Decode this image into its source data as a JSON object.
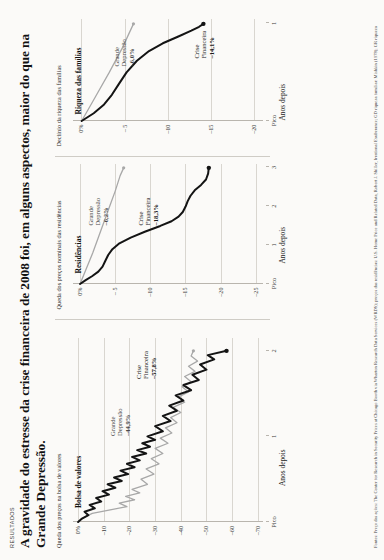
{
  "kicker": "RESULTADOS",
  "headline": "A gravidade do estresse da crise financeira de 2008 foi, em alguns aspectos, maior do que na Grande Depressão.",
  "legend": {
    "great_depression": "Grande Depressão",
    "financial_crisis": "Crise Financeira",
    "color_great_depression": "#a8a8a8",
    "color_financial_crisis": "#141414"
  },
  "axis": {
    "x_label": "Anos depois",
    "peak_label": "Pico"
  },
  "panels": [
    {
      "title": "Bolsa de valores",
      "subtitle": "Queda dos preços na bolsa de valores",
      "yticks": [
        "0%",
        "–10",
        "–20",
        "–30",
        "–40",
        "–50",
        "–60",
        "–70"
      ],
      "ytick_values": [
        0,
        -10,
        -20,
        -30,
        -40,
        -50,
        -60,
        -70
      ],
      "xticks": [
        "Pico",
        "1",
        "2"
      ],
      "xtick_values": [
        0,
        1,
        2
      ],
      "annotations": [
        {
          "name": "Grande Depressão",
          "value": "–44,9%",
          "series": "great_depression"
        },
        {
          "name": "Crise Financeira",
          "value": "–57,8%",
          "series": "financial_crisis"
        }
      ]
    },
    {
      "title": "Residências",
      "subtitle": "Queda dos preços nominais das residências",
      "yticks": [
        "0%",
        "– 5",
        "–10",
        "–15",
        "–20",
        "–25"
      ],
      "ytick_values": [
        0,
        -5,
        -10,
        -15,
        -20,
        -25
      ],
      "xticks": [
        "Pico",
        "1",
        "2",
        "3"
      ],
      "xtick_values": [
        0,
        1,
        2,
        3
      ],
      "annotations": [
        {
          "name": "Grande Depressão",
          "value": "–6,2%",
          "series": "great_depression"
        },
        {
          "name": "Crise Financeira",
          "value": "–18,3%",
          "series": "financial_crisis"
        }
      ]
    },
    {
      "title": "Riqueza das famílias",
      "subtitle": "Declínio da riqueza das famílias",
      "yticks": [
        "0%",
        "– 5",
        "–10",
        "–15",
        "–20"
      ],
      "ytick_values": [
        0,
        -5,
        -10,
        -15,
        -20
      ],
      "xticks": [
        "Pico",
        "1"
      ],
      "xtick_values": [
        0,
        1
      ],
      "annotations": [
        {
          "name": "Grande Depressão",
          "value": "–6,0%",
          "series": "great_depression"
        },
        {
          "name": "Crise Financeira",
          "value": "–14,1%",
          "series": "financial_crisis"
        }
      ]
    }
  ],
  "source": "Fontes: Preço das ações: The Center for Research in Security Prices at Chicago Booth via Wharton Research Data Services (WRDS); preços das residências: U.S. Home Price and Related Data, Robert J. Shiller, Irrational Exuberance; GD riqueza familiar: Mishkin (1978); GR riqueza",
  "chart_data": [
    {
      "type": "line",
      "title": "Bolsa de valores",
      "xlabel": "Anos depois",
      "ylabel": "Queda dos preços na bolsa de valores",
      "xlim": [
        0,
        2.15
      ],
      "ylim": [
        -72,
        2
      ],
      "grid": true,
      "legend_position": "inline-annotation",
      "series": [
        {
          "name": "Grande Depressão",
          "color": "#a8a8a8",
          "points": [
            [
              0.0,
              0.0
            ],
            [
              0.05,
              -2.0
            ],
            [
              0.1,
              -5.5
            ],
            [
              0.14,
              -12.0
            ],
            [
              0.18,
              -19.0
            ],
            [
              0.22,
              -16.0
            ],
            [
              0.26,
              -22.0
            ],
            [
              0.3,
              -18.5
            ],
            [
              0.34,
              -24.0
            ],
            [
              0.38,
              -21.0
            ],
            [
              0.44,
              -27.0
            ],
            [
              0.5,
              -24.5
            ],
            [
              0.56,
              -29.5
            ],
            [
              0.62,
              -26.5
            ],
            [
              0.68,
              -31.5
            ],
            [
              0.74,
              -28.5
            ],
            [
              0.8,
              -33.0
            ],
            [
              0.86,
              -30.0
            ],
            [
              0.92,
              -35.0
            ],
            [
              0.98,
              -32.0
            ],
            [
              1.04,
              -36.5
            ],
            [
              1.1,
              -34.0
            ],
            [
              1.16,
              -38.5
            ],
            [
              1.22,
              -36.0
            ],
            [
              1.28,
              -40.0
            ],
            [
              1.34,
              -37.0
            ],
            [
              1.4,
              -41.5
            ],
            [
              1.46,
              -39.0
            ],
            [
              1.52,
              -43.0
            ],
            [
              1.58,
              -40.5
            ],
            [
              1.64,
              -44.0
            ],
            [
              1.7,
              -41.5
            ],
            [
              1.76,
              -45.5
            ],
            [
              1.82,
              -43.0
            ],
            [
              1.88,
              -46.5
            ],
            [
              1.94,
              -44.0
            ],
            [
              2.0,
              -44.9
            ]
          ],
          "final_value": -44.9
        },
        {
          "name": "Crise Financeira",
          "color": "#141414",
          "points": [
            [
              0.0,
              0.0
            ],
            [
              0.04,
              -1.5
            ],
            [
              0.08,
              -4.0
            ],
            [
              0.12,
              -2.5
            ],
            [
              0.16,
              -6.5
            ],
            [
              0.2,
              -4.5
            ],
            [
              0.24,
              -9.0
            ],
            [
              0.28,
              -7.0
            ],
            [
              0.32,
              -12.0
            ],
            [
              0.36,
              -9.5
            ],
            [
              0.4,
              -14.5
            ],
            [
              0.44,
              -11.5
            ],
            [
              0.48,
              -17.0
            ],
            [
              0.52,
              -14.0
            ],
            [
              0.56,
              -19.5
            ],
            [
              0.6,
              -16.5
            ],
            [
              0.64,
              -22.0
            ],
            [
              0.68,
              -19.0
            ],
            [
              0.72,
              -24.0
            ],
            [
              0.76,
              -21.0
            ],
            [
              0.8,
              -26.5
            ],
            [
              0.84,
              -23.0
            ],
            [
              0.88,
              -28.0
            ],
            [
              0.92,
              -25.0
            ],
            [
              0.96,
              -30.0
            ],
            [
              1.0,
              -27.0
            ],
            [
              1.06,
              -33.0
            ],
            [
              1.12,
              -30.0
            ],
            [
              1.18,
              -36.0
            ],
            [
              1.24,
              -33.0
            ],
            [
              1.3,
              -38.5
            ],
            [
              1.36,
              -35.5
            ],
            [
              1.42,
              -41.0
            ],
            [
              1.48,
              -38.0
            ],
            [
              1.54,
              -44.0
            ],
            [
              1.6,
              -41.0
            ],
            [
              1.66,
              -47.0
            ],
            [
              1.72,
              -44.5
            ],
            [
              1.78,
              -50.0
            ],
            [
              1.84,
              -47.5
            ],
            [
              1.9,
              -53.0
            ],
            [
              1.95,
              -50.5
            ],
            [
              2.0,
              -57.8
            ]
          ],
          "final_value": -57.8
        }
      ]
    },
    {
      "type": "line",
      "title": "Residências",
      "xlabel": "Anos depois",
      "ylabel": "Queda dos preços nominais das residências",
      "xlim": [
        0,
        3.1
      ],
      "ylim": [
        -26,
        1
      ],
      "grid": true,
      "legend_position": "inline-annotation",
      "series": [
        {
          "name": "Grande Depressão",
          "color": "#a8a8a8",
          "points": [
            [
              0.0,
              0.0
            ],
            [
              0.4,
              -0.9
            ],
            [
              0.8,
              -1.8
            ],
            [
              1.2,
              -2.6
            ],
            [
              1.6,
              -3.4
            ],
            [
              2.0,
              -4.2
            ],
            [
              2.4,
              -5.0
            ],
            [
              2.8,
              -5.7
            ],
            [
              3.0,
              -6.2
            ]
          ],
          "final_value": -6.2
        },
        {
          "name": "Crise Financeira",
          "color": "#141414",
          "points": [
            [
              0.0,
              0.0
            ],
            [
              0.1,
              -0.8
            ],
            [
              0.2,
              -1.7
            ],
            [
              0.32,
              -2.6
            ],
            [
              0.45,
              -3.2
            ],
            [
              0.6,
              -3.6
            ],
            [
              0.75,
              -4.0
            ],
            [
              0.9,
              -4.6
            ],
            [
              1.05,
              -5.6
            ],
            [
              1.2,
              -7.2
            ],
            [
              1.35,
              -9.2
            ],
            [
              1.5,
              -11.4
            ],
            [
              1.62,
              -13.0
            ],
            [
              1.74,
              -14.0
            ],
            [
              1.86,
              -14.6
            ],
            [
              2.0,
              -15.0
            ],
            [
              2.14,
              -15.3
            ],
            [
              2.28,
              -15.7
            ],
            [
              2.42,
              -16.3
            ],
            [
              2.56,
              -17.2
            ],
            [
              2.7,
              -17.9
            ],
            [
              2.85,
              -18.2
            ],
            [
              3.0,
              -18.3
            ]
          ],
          "final_value": -18.3
        }
      ]
    },
    {
      "type": "line",
      "title": "Riqueza das famílias",
      "xlabel": "Anos depois",
      "ylabel": "Declínio da riqueza das famílias",
      "xlim": [
        0,
        1.05
      ],
      "ylim": [
        -21,
        1
      ],
      "grid": true,
      "legend_position": "inline-annotation",
      "series": [
        {
          "name": "Grande Depressão",
          "color": "#a8a8a8",
          "points": [
            [
              0.0,
              0.0
            ],
            [
              0.25,
              -1.6
            ],
            [
              0.5,
              -3.2
            ],
            [
              0.75,
              -4.7
            ],
            [
              1.0,
              -6.0
            ]
          ],
          "final_value": -6.0
        },
        {
          "name": "Crise Financeira",
          "color": "#141414",
          "points": [
            [
              0.0,
              0.0
            ],
            [
              0.08,
              -1.4
            ],
            [
              0.17,
              -2.6
            ],
            [
              0.27,
              -3.5
            ],
            [
              0.38,
              -4.3
            ],
            [
              0.5,
              -5.2
            ],
            [
              0.62,
              -6.4
            ],
            [
              0.72,
              -7.8
            ],
            [
              0.8,
              -9.4
            ],
            [
              0.87,
              -11.2
            ],
            [
              0.93,
              -12.7
            ],
            [
              0.97,
              -13.6
            ],
            [
              1.0,
              -14.1
            ]
          ],
          "final_value": -14.1
        }
      ]
    }
  ]
}
